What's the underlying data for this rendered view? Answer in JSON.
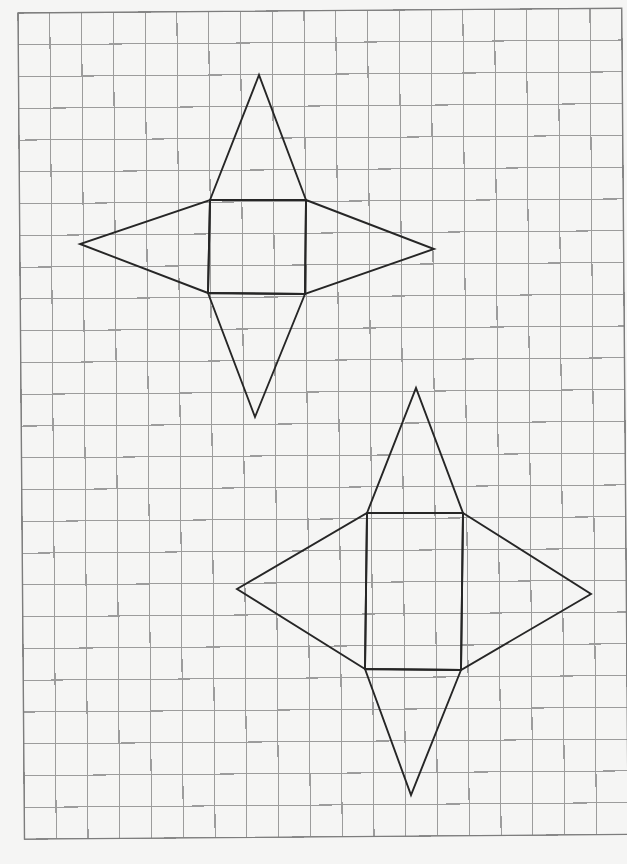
{
  "title": "Nets of two pyramids on square grid paper",
  "paper": {
    "background": "#f5f5f4",
    "grid_color": "#9c9c9c",
    "line_color": "#262626",
    "cell_size_px": 32,
    "columns": 19,
    "rows": 26,
    "origin": [
      18,
      13
    ],
    "rotation_deg": -0.45
  },
  "nets": [
    {
      "name": "square-pyramid-net",
      "base": {
        "shape": "square",
        "cells": "3x3",
        "corners": [
          [
            210,
            200
          ],
          [
            306,
            200
          ],
          [
            305,
            294
          ],
          [
            208,
            293
          ]
        ]
      },
      "triangles": [
        {
          "side": "top",
          "apex": [
            259,
            75
          ]
        },
        {
          "side": "right",
          "apex": [
            434,
            249
          ]
        },
        {
          "side": "bottom",
          "apex": [
            255,
            417
          ]
        },
        {
          "side": "left",
          "apex": [
            80,
            244
          ]
        }
      ]
    },
    {
      "name": "rectangular-pyramid-net",
      "base": {
        "shape": "rectangle",
        "cells": "3x5",
        "corners": [
          [
            367,
            513
          ],
          [
            463,
            513
          ],
          [
            461,
            670
          ],
          [
            365,
            669
          ]
        ]
      },
      "triangles": [
        {
          "side": "top",
          "apex": [
            416,
            388
          ]
        },
        {
          "side": "right",
          "apex": [
            591,
            594
          ]
        },
        {
          "side": "bottom",
          "apex": [
            411,
            795
          ]
        },
        {
          "side": "left",
          "apex": [
            237,
            589
          ]
        }
      ]
    }
  ]
}
